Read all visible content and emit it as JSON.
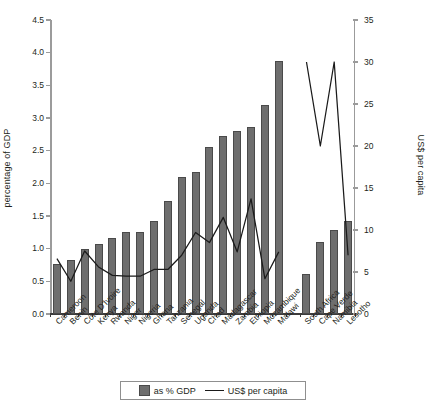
{
  "chart_data": {
    "type": "bar",
    "title": "",
    "subtitle": "",
    "categories": [
      "Cameroon",
      "Benin",
      "Côte D'Ivoire",
      "Kenya",
      "Rwanda",
      "Niger",
      "Nigeria",
      "Ghana",
      "Tanzania",
      "Senegal",
      "Uganda",
      "Chad",
      "Madagascar",
      "Zambia",
      "Ethiopia",
      "Mozambique",
      "Malawi",
      "",
      "South Africa",
      "Cape Verde",
      "Namibia",
      "Lesotho"
    ],
    "series": [
      {
        "name": "as % GDP",
        "type": "bar",
        "axis": "left",
        "values": [
          0.77,
          0.82,
          1.0,
          1.07,
          1.17,
          1.25,
          1.26,
          1.43,
          1.73,
          2.1,
          2.17,
          2.55,
          2.72,
          2.8,
          2.86,
          3.2,
          3.53,
          null,
          0.62,
          1.1,
          1.28,
          1.43
        ]
      },
      {
        "name": "US$ per capita",
        "type": "line",
        "axis": "right",
        "values": [
          6.6,
          3.9,
          7.5,
          5.6,
          4.6,
          4.5,
          4.5,
          5.3,
          5.3,
          7.0,
          9.7,
          8.5,
          11.5,
          7.4,
          13.7,
          4.2,
          7.4,
          null,
          30.0,
          20.0,
          30.0,
          7.0
        ]
      }
    ],
    "malawi_bar_value": 3.88,
    "xlabel": "",
    "ylabel": "percentage of GDP",
    "y2label": "US$ per capita",
    "yticks": [
      "0.0",
      "0.5",
      "1.0",
      "1.5",
      "2.0",
      "2.5",
      "3.0",
      "3.5",
      "4.0",
      "4.5"
    ],
    "ylim": [
      0,
      4.5
    ],
    "y2ticks": [
      "0",
      "5",
      "10",
      "15",
      "20",
      "25",
      "30",
      "35"
    ],
    "y2lim": [
      0,
      35
    ],
    "grid": false,
    "legend_position": "bottom-center",
    "legend": [
      "as % GDP",
      "US$ per capita"
    ]
  },
  "axes": {
    "left_title": "percentage of GDP",
    "right_title": "US$ per capita"
  },
  "legend": {
    "bar_label": "as % GDP",
    "line_label": "US$ per capita"
  },
  "colors": {
    "bar_fill": "#6e6e6e",
    "bar_stroke": "#4a4a4a",
    "line": "#1a1a1a",
    "axis": "#9b9b9b",
    "baseline": "#3b3b3b",
    "text": "#231f20",
    "background": "#ffffff"
  }
}
